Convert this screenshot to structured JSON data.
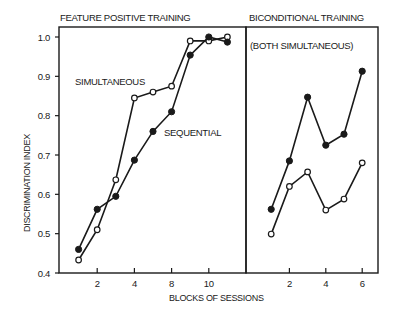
{
  "chart_data": {
    "type": "line",
    "ylabel": "DISCRIMINATION INDEX",
    "xlabel": "BLOCKS OF SESSIONS",
    "ylim": [
      0.4,
      1.0
    ],
    "yticks": [
      "0.4",
      "0.5",
      "0.6",
      "0.7",
      "0.8",
      "0.9",
      "1.0"
    ],
    "yticks_values": [
      0.4,
      0.5,
      0.6,
      0.7,
      0.8,
      0.9,
      1.0
    ],
    "grid": false,
    "panels": [
      {
        "title": "FEATURE POSITIVE TRAINING",
        "subtitle": "",
        "xlim": [
          0,
          10.7
        ],
        "xticks_values": [
          2,
          4,
          6,
          8
        ],
        "xtick_labels": [
          "2",
          "4",
          "8",
          "10"
        ],
        "series": [
          {
            "name": "SIMULTANEOUS",
            "marker": "open",
            "x": [
              1,
              2,
              3,
              4,
              5,
              6,
              7,
              8,
              9
            ],
            "values": [
              0.433,
              0.51,
              0.637,
              0.845,
              0.86,
              0.875,
              0.99,
              0.99,
              1.0
            ]
          },
          {
            "name": "SEQUENTIAL",
            "marker": "filled",
            "x": [
              1,
              2,
              3,
              4,
              5,
              6,
              7,
              8,
              9
            ],
            "values": [
              0.46,
              0.562,
              0.595,
              0.687,
              0.76,
              0.81,
              0.954,
              1.0,
              0.987
            ]
          }
        ]
      },
      {
        "title": "BICONDITIONAL TRAINING",
        "subtitle": "(BOTH SIMULTANEOUS)",
        "xlim": [
          0,
          7
        ],
        "xticks_values": [
          2,
          4,
          6
        ],
        "xtick_labels": [
          "2",
          "4",
          "6"
        ],
        "series": [
          {
            "name": "filled",
            "marker": "filled",
            "x": [
              1,
              2,
              3,
              4,
              5,
              6
            ],
            "values": [
              0.562,
              0.685,
              0.847,
              0.725,
              0.753,
              0.913
            ]
          },
          {
            "name": "open",
            "marker": "open",
            "x": [
              1,
              2,
              3,
              4,
              5,
              6
            ],
            "values": [
              0.499,
              0.62,
              0.657,
              0.56,
              0.588,
              0.68
            ]
          }
        ]
      }
    ]
  }
}
